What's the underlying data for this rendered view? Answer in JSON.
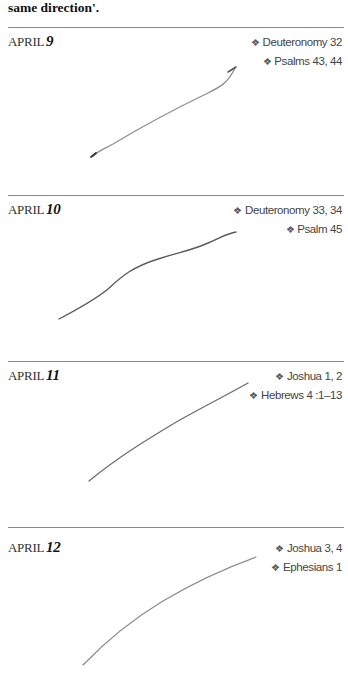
{
  "intro_text": "same direction'.",
  "entries": [
    {
      "month": "APRIL",
      "day": "9",
      "readings": [
        "Deuteronomy 32",
        "Psalms 43, 44"
      ]
    },
    {
      "month": "APRIL",
      "day": "10",
      "readings": [
        "Deuteronomy 33, 34",
        "Psalm 45"
      ]
    },
    {
      "month": "APRIL",
      "day": "11",
      "readings": [
        "Joshua 1, 2",
        "Hebrews 4 :1–13"
      ]
    },
    {
      "month": "APRIL",
      "day": "12",
      "readings": [
        "Joshua 3, 4",
        "Ephesians 1"
      ]
    }
  ],
  "bullet_glyph": "❖",
  "sketch_color": "#6a6a6a"
}
